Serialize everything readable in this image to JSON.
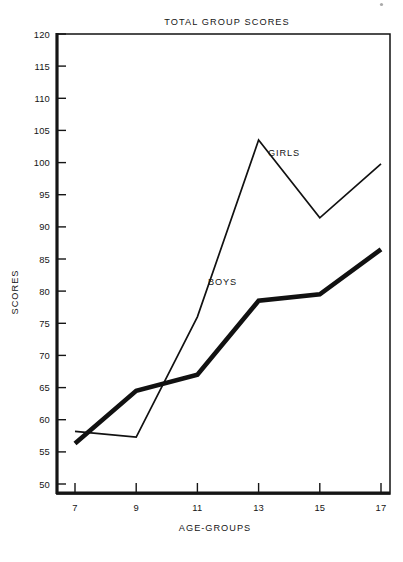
{
  "chart_data": {
    "type": "line",
    "title": "TOTAL  GROUP  SCORES",
    "xlabel": "AGE-GROUPS",
    "ylabel": "SCORES",
    "x": [
      7,
      9,
      11,
      13,
      15,
      17
    ],
    "categories": [
      "7",
      "9",
      "11",
      "13",
      "15",
      "17"
    ],
    "xlim": [
      6,
      18
    ],
    "ylim": [
      48,
      120
    ],
    "xticks": [
      "7",
      "9",
      "11",
      "13",
      "15",
      "17"
    ],
    "yticks": [
      "50",
      "55",
      "60",
      "65",
      "70",
      "75",
      "80",
      "85",
      "90",
      "95",
      "100",
      "105",
      "110",
      "115",
      "120"
    ],
    "grid": false,
    "legend_position": "inline-annotations",
    "series": [
      {
        "name": "GIRLS",
        "style": "thin",
        "color": "#111111",
        "values": [
          58.2,
          57.3,
          76.0,
          103.5,
          91.4,
          99.8
        ]
      },
      {
        "name": "BOYS",
        "style": "thick",
        "color": "#111111",
        "values": [
          56.3,
          64.5,
          67.0,
          78.5,
          79.5,
          86.5
        ]
      }
    ],
    "annotations": [
      {
        "text": "GIRLS",
        "x": 13.9,
        "y": 101.0
      },
      {
        "text": "BOYS",
        "x": 12.1,
        "y": 82.2
      }
    ]
  }
}
